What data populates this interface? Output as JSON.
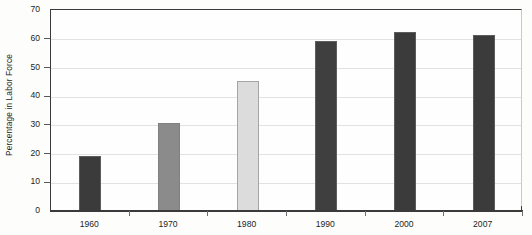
{
  "chart_data": {
    "type": "bar",
    "title": "",
    "subtitle": "",
    "xlabel": "",
    "ylabel": "Percentage in Labor Force",
    "categories": [
      "1960",
      "1970",
      "1980",
      "1990",
      "2000",
      "2007"
    ],
    "values": [
      19,
      30.5,
      45,
      59,
      62,
      61
    ],
    "ylim": [
      0,
      70
    ],
    "ytick_labels": [
      "0",
      "10",
      "20",
      "30",
      "40",
      "50",
      "60",
      "70"
    ],
    "ytick_values": [
      0,
      10,
      20,
      30,
      40,
      50,
      60,
      70
    ],
    "grid": "horizontal",
    "legend": "none",
    "bar_colors": [
      "#3b3b3b",
      "#8b8b8b",
      "#dcdcdc",
      "#3f3f3f",
      "#3b3b3b",
      "#3b3b3b"
    ],
    "series": [
      {
        "name": "Percentage in Labor Force",
        "values": [
          19,
          30.5,
          45,
          59,
          62,
          61
        ]
      }
    ],
    "points": [
      {
        "category": "1960",
        "value": 19,
        "color": "#3b3b3b"
      },
      {
        "category": "1970",
        "value": 30.5,
        "color": "#8b8b8b"
      },
      {
        "category": "1980",
        "value": 45,
        "color": "#dcdcdc"
      },
      {
        "category": "1990",
        "value": 59,
        "color": "#3f3f3f"
      },
      {
        "category": "2000",
        "value": 62,
        "color": "#3b3b3b"
      },
      {
        "category": "2007",
        "value": 61,
        "color": "#3b3b3b"
      }
    ]
  },
  "axes": {
    "y_title": "Percentage in Labor Force",
    "y_ticks": [
      "70",
      "60",
      "50",
      "40",
      "30",
      "20",
      "10",
      "0"
    ],
    "x_ticks": [
      "1960",
      "1970",
      "1980",
      "1990",
      "2000",
      "2007"
    ]
  },
  "colors": {
    "axis": "#3a3a3a",
    "grid": "#e2e2e2",
    "text": "#231f20",
    "background": "#fdfdfc"
  }
}
